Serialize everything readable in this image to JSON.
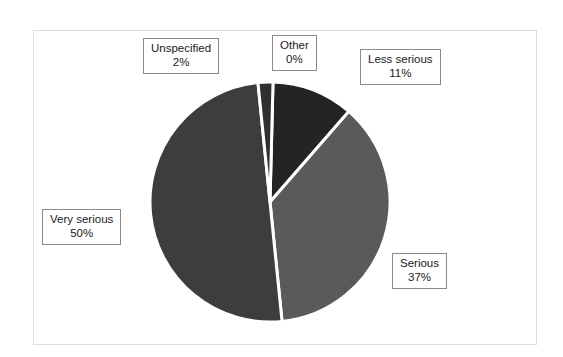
{
  "chart_data": {
    "type": "pie",
    "title": "",
    "categories": [
      "Other",
      "Less serious",
      "Serious",
      "Very serious",
      "Unspecified"
    ],
    "values": [
      0,
      11,
      37,
      50,
      2
    ],
    "value_unit": "%",
    "labels": [
      {
        "name": "Other",
        "percent": "0%",
        "value": 0,
        "color": "#262626"
      },
      {
        "name": "Less serious",
        "percent": "11%",
        "value": 11,
        "color": "#242424"
      },
      {
        "name": "Serious",
        "percent": "37%",
        "value": 37,
        "color": "#5a5a5a"
      },
      {
        "name": "Very serious",
        "percent": "50%",
        "value": 50,
        "color": "#3d3d3d"
      },
      {
        "name": "Unspecified",
        "percent": "2%",
        "value": 2,
        "color": "#303030"
      }
    ],
    "legend_position": "callout-boxes",
    "grid": false,
    "slice_separator_color": "#ffffff",
    "background_color": "#ffffff",
    "frame_color": "#dedede",
    "geometry": {
      "center_x": 270,
      "center_y": 202,
      "radius": 120,
      "start_angle_deg": -90,
      "direction": "clockwise"
    }
  },
  "callouts": {
    "unspecified": {
      "category": "Unspecified",
      "percent": "2%"
    },
    "other": {
      "category": "Other",
      "percent": "0%"
    },
    "less": {
      "category": "Less serious",
      "percent": "11%"
    },
    "very": {
      "category": "Very serious",
      "percent": "50%"
    },
    "serious": {
      "category": "Serious",
      "percent": "37%"
    }
  }
}
